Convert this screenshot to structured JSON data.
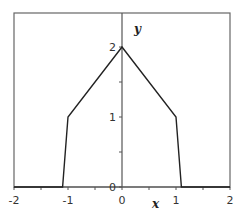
{
  "chart_data": {
    "type": "line",
    "title": "",
    "xlabel": "x",
    "ylabel": "y",
    "xlim": [
      -2,
      2
    ],
    "ylim": [
      0,
      2.486
    ],
    "grid": false,
    "legend": null,
    "x_ticks": [
      -2,
      -1,
      0,
      1,
      2
    ],
    "x_tick_labels": [
      "-2",
      "-1",
      "0",
      "1",
      "2"
    ],
    "x_minor_ticks": [
      -1.5,
      -0.5,
      0.5,
      1.5
    ],
    "y_ticks": [
      0,
      1,
      2
    ],
    "y_tick_labels": [
      "0",
      "1",
      "2"
    ],
    "y_minor_ticks": [
      0.5,
      1.5
    ],
    "series": [
      {
        "name": "f(x)",
        "color": "#222222",
        "x": [
          -2,
          -1.1,
          -1,
          0,
          1,
          1.1,
          2
        ],
        "y": [
          0,
          0,
          1,
          2,
          1,
          0,
          0
        ]
      }
    ]
  },
  "style": {
    "axis_color": "#555555",
    "frame_color": "#666666",
    "line_color": "#222222"
  }
}
